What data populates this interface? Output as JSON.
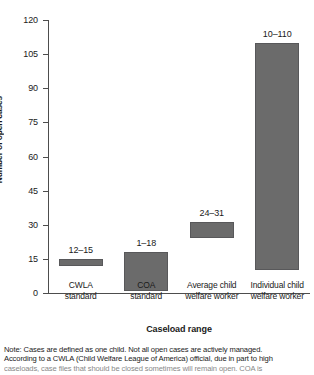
{
  "chart_data": {
    "type": "bar",
    "subtype": "floating-range-bar",
    "title": "",
    "xlabel": "Caseload range",
    "ylabel": "Number of open cases",
    "ylim": [
      0,
      120
    ],
    "yticks": [
      0,
      15,
      30,
      45,
      60,
      75,
      90,
      105,
      120
    ],
    "ytick_labels": [
      "0",
      "15",
      "30",
      "45",
      "60",
      "75",
      "90",
      "105",
      "120"
    ],
    "grid": false,
    "legend": "none",
    "categories": [
      "CWLA standard",
      "COA standard",
      "Average child welfare worker",
      "Individual child welfare worker"
    ],
    "category_lines": [
      [
        "CWLA",
        "standard"
      ],
      [
        "COA",
        "standard"
      ],
      [
        "Average child",
        "welfare worker"
      ],
      [
        "Individual child",
        "welfare worker"
      ]
    ],
    "low_values": [
      12,
      1,
      24,
      10
    ],
    "high_values": [
      15,
      18,
      31,
      110
    ],
    "value_labels": [
      "12–15",
      "1–18",
      "24–31",
      "10–110"
    ],
    "bar_color": "#6b6b6b",
    "bar_edge_color": "#58585a",
    "axis_color": "#4d4d4d"
  },
  "note": {
    "lines": [
      "Note: Cases are defined as one child. Not all open cases are actively managed.",
      "According to a CWLA (Child Welfare League of America) official, due in part to high",
      "caseloads, case files that should be closed sometimes will remain open. COA is"
    ]
  }
}
